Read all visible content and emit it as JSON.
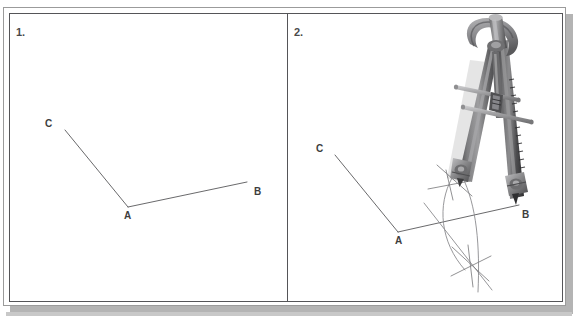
{
  "figure": {
    "background_color": "#ffffff",
    "frame_border_color": "#555558",
    "shadow_color": "#b4b4b4",
    "line_color": "#58585a",
    "arc_color": "#8b8b8e",
    "label_color": "#3d3d3d"
  },
  "panels": [
    {
      "number": "1.",
      "name": "step-one-angle-only",
      "labels": {
        "a": "A",
        "b": "B",
        "c": "C"
      },
      "points": {
        "A": {
          "x": 128,
          "y": 207
        },
        "B": {
          "x": 247,
          "y": 182
        },
        "C": {
          "x": 65,
          "y": 130
        }
      },
      "label_positions": {
        "A": {
          "x": 124,
          "y": 219
        },
        "B": {
          "x": 254,
          "y": 195
        },
        "C": {
          "x": 45,
          "y": 127
        }
      },
      "has_compass": false,
      "has_arcs": false
    },
    {
      "number": "2.",
      "name": "step-two-compass-arcs",
      "labels": {
        "a": "A",
        "b": "B",
        "c": "C"
      },
      "points": {
        "A": {
          "x": 398,
          "y": 232
        },
        "B": {
          "x": 519,
          "y": 205
        },
        "C": {
          "x": 335,
          "y": 155
        }
      },
      "label_positions": {
        "A": {
          "x": 395,
          "y": 244
        },
        "B": {
          "x": 522,
          "y": 218
        },
        "C": {
          "x": 316,
          "y": 152
        }
      },
      "has_compass": true,
      "has_arcs": true,
      "compass": {
        "name": "drawing-compass",
        "pivot_point": {
          "x": 510,
          "y": 203
        },
        "pencil_point": {
          "x": 460,
          "y": 178
        },
        "handle_top": {
          "x": 496,
          "y": 22
        },
        "body_color": "#6e6e70",
        "body_highlight": "#9a9a9c",
        "body_shadow": "#3a3a3c",
        "crossbar_color": "#a8a8aa"
      },
      "arc_intersections": [
        {
          "name": "upper-crossing",
          "x": 459,
          "y": 180
        },
        {
          "name": "lower-crossing",
          "x": 470,
          "y": 264
        }
      ]
    }
  ]
}
